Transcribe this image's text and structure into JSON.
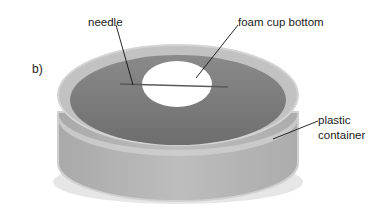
{
  "figure": {
    "panel_label": "b)",
    "labels": {
      "needle": "needle",
      "foam": "foam cup bottom",
      "plastic_line1": "plastic",
      "plastic_line2": "container"
    },
    "colors": {
      "container_wall": "#b4b4b4",
      "water": "#7c7c7c",
      "foam": "#ffffff",
      "needle": "#555555"
    }
  }
}
